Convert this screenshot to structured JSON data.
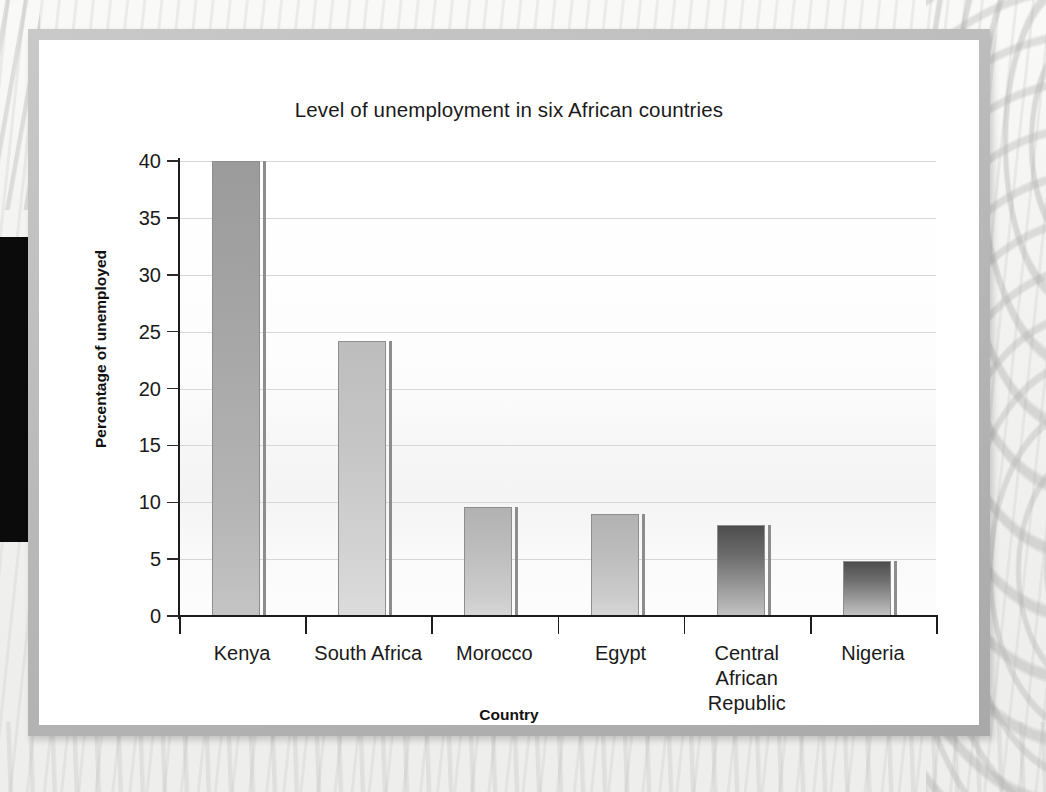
{
  "figure": {
    "title": "Level of unemployment in six African countries"
  },
  "chart_data": {
    "type": "bar",
    "title": "Level of unemployment in six African countries",
    "xlabel": "Country",
    "ylabel": "Percentage of unemployed",
    "categories": [
      "Kenya",
      "South Africa",
      "Morocco",
      "Egypt",
      "Central African Republic",
      "Nigeria"
    ],
    "category_lines": [
      [
        "Kenya"
      ],
      [
        "South Africa"
      ],
      [
        "Morocco"
      ],
      [
        "Egypt"
      ],
      [
        "Central",
        "African",
        "Republic"
      ],
      [
        "Nigeria"
      ]
    ],
    "values": [
      40,
      24.2,
      9.6,
      9,
      8,
      4.8
    ],
    "ylim": [
      0,
      40
    ],
    "yticks": [
      0,
      5,
      10,
      15,
      20,
      25,
      30,
      35,
      40
    ],
    "ytick_labels": [
      "0",
      "5",
      "10",
      "15",
      "20",
      "25",
      "30",
      "35",
      "40"
    ],
    "grid": true,
    "grid_axis": "y",
    "legend": "none",
    "bar_color": "#a8a8a8",
    "bar_edge_color": "#8d8d8d",
    "axis_color": "#1c1c1c",
    "gridline_color": "#d7d7d7",
    "plot_background": "#fbfbfb"
  }
}
